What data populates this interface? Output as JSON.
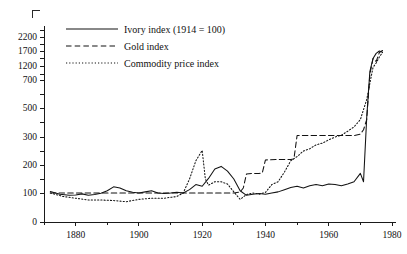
{
  "figure": {
    "title_partial": "",
    "background_color": "#ffffff",
    "ink_color": "#121212"
  },
  "legend": {
    "position": "top-left-inside",
    "entries": [
      {
        "label": "Ivory index (1914 = 100)",
        "style": "solid",
        "key": "ivory"
      },
      {
        "label": "Gold index",
        "style": "dashed",
        "key": "gold"
      },
      {
        "label": "Commodity price index",
        "style": "dotted",
        "key": "commodity"
      }
    ]
  },
  "axes": {
    "x": {
      "label": "",
      "min": 1870,
      "max": 1980,
      "major_ticks": [
        1880,
        1900,
        1920,
        1940,
        1960,
        1980
      ],
      "major_tick_labels": [
        "1880",
        "1900",
        "1920",
        "1940",
        "1960",
        "1980"
      ],
      "minor_ticks": [
        1870,
        1890,
        1910,
        1930,
        1950,
        1970
      ]
    },
    "y": {
      "label": "",
      "scale": "piecewise-log-like",
      "ticks": [
        0,
        100,
        200,
        300,
        500,
        700,
        1200,
        1700,
        2200
      ],
      "tick_labels": [
        "0",
        "100",
        "200",
        "300",
        "500",
        "700",
        "1200",
        "1700",
        "2200"
      ],
      "unlabeled_ticks": [
        150,
        250,
        400,
        600,
        900,
        1450,
        1950,
        2450
      ]
    },
    "grid": false
  },
  "chart_data": {
    "type": "line",
    "title": "Ivory index (1914 = 100)",
    "xlabel": "",
    "ylabel": "",
    "xlim": [
      1870,
      1980
    ],
    "ylim": [
      0,
      2450
    ],
    "grid": false,
    "legend_position": "top-left",
    "yscale": "piecewise-log-like",
    "yticks": [
      0,
      100,
      200,
      300,
      500,
      700,
      1200,
      1700,
      2200
    ],
    "xticks": [
      1880,
      1900,
      1920,
      1940,
      1960,
      1980
    ],
    "series": [
      {
        "name": "Ivory index (1914 = 100)",
        "style": "solid",
        "x": [
          1872,
          1875,
          1878,
          1880,
          1882,
          1884,
          1886,
          1888,
          1890,
          1892,
          1894,
          1896,
          1898,
          1900,
          1902,
          1904,
          1906,
          1908,
          1910,
          1912,
          1914,
          1916,
          1918,
          1920,
          1922,
          1924,
          1926,
          1928,
          1930,
          1932,
          1934,
          1936,
          1938,
          1940,
          1942,
          1944,
          1946,
          1948,
          1950,
          1952,
          1954,
          1956,
          1958,
          1960,
          1962,
          1964,
          1966,
          1968,
          1970,
          1971,
          1972,
          1973,
          1974,
          1975,
          1976,
          1977
        ],
        "values": [
          105,
          96,
          92,
          93,
          97,
          92,
          95,
          99,
          108,
          122,
          118,
          108,
          103,
          100,
          104,
          108,
          100,
          98,
          100,
          103,
          100,
          112,
          130,
          124,
          152,
          186,
          195,
          178,
          150,
          108,
          92,
          96,
          98,
          96,
          100,
          104,
          112,
          120,
          124,
          118,
          126,
          130,
          126,
          132,
          130,
          126,
          132,
          140,
          170,
          140,
          430,
          1000,
          1450,
          1620,
          1700,
          1660
        ]
      },
      {
        "name": "Gold index",
        "style": "dashed",
        "x": [
          1872,
          1880,
          1890,
          1900,
          1910,
          1914,
          1920,
          1924,
          1928,
          1930,
          1932,
          1933,
          1934,
          1936,
          1938,
          1939,
          1940,
          1944,
          1948,
          1949,
          1950,
          1960,
          1965,
          1968,
          1970,
          1971,
          1972,
          1973,
          1974,
          1975,
          1976,
          1977
        ],
        "values": [
          100,
          100,
          100,
          100,
          100,
          100,
          100,
          100,
          100,
          100,
          104,
          118,
          168,
          170,
          170,
          172,
          218,
          220,
          220,
          222,
          310,
          310,
          310,
          310,
          320,
          350,
          420,
          900,
          1450,
          1350,
          1650,
          1720
        ]
      },
      {
        "name": "Commodity price index",
        "style": "dotted",
        "x": [
          1872,
          1876,
          1880,
          1884,
          1888,
          1892,
          1896,
          1900,
          1904,
          1908,
          1912,
          1914,
          1916,
          1918,
          1920,
          1921,
          1922,
          1924,
          1926,
          1928,
          1930,
          1932,
          1934,
          1936,
          1938,
          1940,
          1942,
          1944,
          1946,
          1948,
          1950,
          1952,
          1954,
          1956,
          1958,
          1960,
          1962,
          1964,
          1966,
          1968,
          1970,
          1972,
          1974,
          1975,
          1976,
          1977
        ],
        "values": [
          100,
          88,
          82,
          76,
          76,
          74,
          70,
          78,
          82,
          82,
          88,
          100,
          150,
          215,
          252,
          150,
          128,
          140,
          140,
          132,
          104,
          78,
          95,
          100,
          96,
          102,
          130,
          140,
          175,
          215,
          230,
          250,
          258,
          272,
          278,
          290,
          300,
          312,
          340,
          370,
          420,
          560,
          1150,
          1300,
          1500,
          1650
        ]
      }
    ]
  }
}
